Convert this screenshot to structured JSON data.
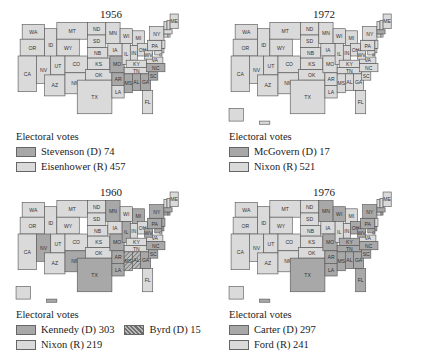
{
  "colors": {
    "dem": "#a8a8a8",
    "rep": "#dadada",
    "byrd_hatch": "#6e6e6e",
    "border": "#555555"
  },
  "maps": [
    {
      "year": "1956",
      "legend_title": "Electoral votes",
      "entries": [
        {
          "label": "Stevenson (D) 74",
          "party": "dem"
        },
        {
          "label": "Eisenhower (R) 457",
          "party": "rep"
        }
      ],
      "dem_states": [
        "MO",
        "AR",
        "MS",
        "AL",
        "GA",
        "SC",
        "NC"
      ]
    },
    {
      "year": "1972",
      "legend_title": "Electoral votes",
      "entries": [
        {
          "label": "McGovern (D) 17",
          "party": "dem"
        },
        {
          "label": "Nixon (R) 521",
          "party": "rep"
        }
      ],
      "dem_states": [
        "MA",
        "DC"
      ]
    },
    {
      "year": "1960",
      "legend_title": "Electoral votes",
      "entries": [
        {
          "label": "Kennedy (D) 303",
          "party": "dem"
        },
        {
          "label": "Byrd (D) 15",
          "party": "byrd"
        },
        {
          "label": "Nixon (R) 219",
          "party": "rep"
        }
      ],
      "dem_states": [
        "NV",
        "NM",
        "TX",
        "MN",
        "MO",
        "AR",
        "IL",
        "MI",
        "LA",
        "GA",
        "SC",
        "NC",
        "PA",
        "WV",
        "NY",
        "NJ",
        "MD",
        "DE",
        "RI",
        "CT",
        "MA",
        "HI"
      ],
      "byrd_states": [
        "MS",
        "AL"
      ]
    },
    {
      "year": "1976",
      "legend_title": "Electoral votes",
      "entries": [
        {
          "label": "Carter (D) 297",
          "party": "dem"
        },
        {
          "label": "Ford (R) 241",
          "party": "rep"
        }
      ],
      "dem_states": [
        "MN",
        "WI",
        "TX",
        "MO",
        "AR",
        "LA",
        "MS",
        "AL",
        "GA",
        "FL",
        "SC",
        "NC",
        "TN",
        "KY",
        "OH",
        "PA",
        "WV",
        "NY",
        "MD",
        "DE",
        "DC",
        "RI",
        "MA",
        "HI"
      ]
    }
  ],
  "state_labels": [
    "WA",
    "OR",
    "CA",
    "ID",
    "NV",
    "MT",
    "WY",
    "UT",
    "AZ",
    "CO",
    "NM",
    "ND",
    "SD",
    "NB",
    "KS",
    "OK",
    "TX",
    "MN",
    "IA",
    "MO",
    "AR",
    "LA",
    "WI",
    "IL",
    "MI",
    "IN",
    "OH",
    "KY",
    "TN",
    "MS",
    "AL",
    "GA",
    "FL",
    "SC",
    "NC",
    "VA",
    "WV",
    "PA",
    "NY",
    "NJ",
    "DE",
    "MD",
    "DC",
    "CT",
    "RI",
    "MA",
    "VT",
    "NH",
    "ME",
    "AK",
    "HI"
  ]
}
